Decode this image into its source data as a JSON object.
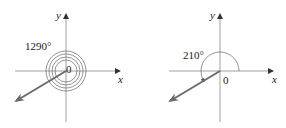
{
  "figures": [
    {
      "id": "left",
      "angle_label": "1290°",
      "angle_degrees": 1290,
      "full_rotations": 3,
      "terminal_angle_degrees": 210,
      "origin_label": "0",
      "x_axis_label": "x",
      "y_axis_label": "y"
    },
    {
      "id": "right",
      "angle_label": "210°",
      "angle_degrees": 210,
      "terminal_angle_degrees": 210,
      "origin_label": "0",
      "x_axis_label": "x",
      "y_axis_label": "y"
    }
  ],
  "colors": {
    "axis": "#555555",
    "arc": "#666666",
    "ray": "#6b6b6b",
    "text": "#222222"
  }
}
